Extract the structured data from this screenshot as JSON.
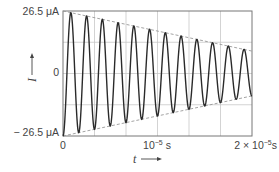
{
  "chart_data": {
    "type": "line",
    "title": "",
    "xlabel": "t",
    "ylabel": "I",
    "x_unit": "s",
    "y_unit": "μA",
    "xlim": [
      0,
      2e-05
    ],
    "ylim": [
      -26.5,
      26.5
    ],
    "grid": true,
    "grid_divisions": {
      "x": 6,
      "y": 4
    },
    "legend": null,
    "x_tick_labels": [
      "0",
      "10⁻⁵ s",
      "2 × 10⁻⁵ s"
    ],
    "x_ticks": [
      0,
      1e-05,
      2e-05
    ],
    "y_tick_labels": [
      "26.5 μA",
      "0",
      "− 26.5 μA"
    ],
    "y_ticks": [
      26.5,
      0,
      -26.5
    ],
    "series": [
      {
        "name": "damped oscillation current",
        "style": "solid",
        "color": "#222222",
        "description": "Damped sinusoidal current starting at −26.5 μA, about 12 cycles over 2×10⁻⁵ s (≈600 kHz), amplitude decaying to ≈9.5 μA",
        "cycles": 12,
        "frequency_hz": 600000,
        "initial_amplitude": 26.5,
        "final_amplitude": 9.5,
        "initial_phase": "minimum"
      },
      {
        "name": "upper envelope",
        "style": "dashed",
        "color": "#888888",
        "x": [
          0,
          2e-05
        ],
        "y": [
          26.5,
          9.5
        ]
      },
      {
        "name": "lower envelope",
        "style": "dashed",
        "color": "#888888",
        "x": [
          0,
          2e-05
        ],
        "y": [
          -26.5,
          -9.5
        ]
      }
    ]
  },
  "labels": {
    "y_top": "26.5 μA",
    "y_zero": "0",
    "y_bottom": "− 26.5 μA",
    "x_zero": "0",
    "x_mid_base": "10",
    "x_mid_exp": "−5",
    "x_mid_unit": " s",
    "x_end_prefix": "2 × 10",
    "x_end_exp": "−5",
    "x_end_unit": "s",
    "y_axis": "I",
    "x_axis": "t"
  }
}
